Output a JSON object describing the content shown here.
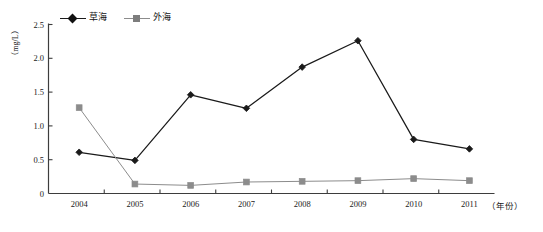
{
  "chart_data": {
    "type": "line",
    "title": "",
    "xlabel": "（年份）",
    "ylabel": "（mg/L）",
    "categories": [
      "2004",
      "2005",
      "2006",
      "2007",
      "2008",
      "2009",
      "2010",
      "2011"
    ],
    "ylim": [
      0,
      2.5
    ],
    "yticks": [
      "0",
      "0.5",
      "1.0",
      "1.5",
      "2.0",
      "2.5"
    ],
    "ytick_values": [
      0,
      0.5,
      1.0,
      1.5,
      2.0,
      2.5
    ],
    "grid": false,
    "legend_position": "top-left",
    "series": [
      {
        "name": "草海",
        "marker": "diamond",
        "color": "#1a1a1a",
        "line_style": "solid",
        "values": [
          0.61,
          0.49,
          1.46,
          1.26,
          1.87,
          2.26,
          0.8,
          0.66
        ]
      },
      {
        "name": "外海",
        "marker": "square",
        "color": "#8c8c8c",
        "line_style": "solid",
        "values": [
          1.27,
          0.14,
          0.12,
          0.17,
          0.18,
          0.19,
          0.22,
          0.19
        ]
      }
    ]
  }
}
